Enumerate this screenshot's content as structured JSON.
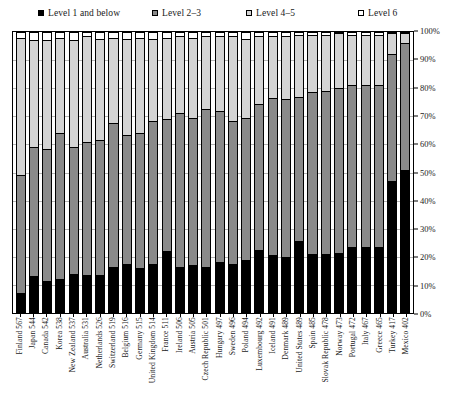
{
  "legend": {
    "items": [
      {
        "label": "Level 1 and below",
        "color": "#000000",
        "key": "l1"
      },
      {
        "label": "Level 2–3",
        "color": "#8a8a8a",
        "key": "l23"
      },
      {
        "label": "Level 4–5",
        "color": "#d4d4d4",
        "key": "l45"
      },
      {
        "label": "Level 6",
        "color": "#ffffff",
        "key": "l6"
      }
    ]
  },
  "chart_data": {
    "type": "bar",
    "subtype": "stacked-bar-100-percent",
    "title": "",
    "xlabel": "",
    "ylabel": "",
    "ylim": [
      0,
      100
    ],
    "ytick_labels": [
      "0%",
      "10%",
      "20%",
      "30%",
      "40%",
      "50%",
      "60%",
      "70%",
      "80%",
      "90%",
      "100%"
    ],
    "ytick_values": [
      0,
      10,
      20,
      30,
      40,
      50,
      60,
      70,
      80,
      90,
      100
    ],
    "yaxis_position": "right",
    "grid": true,
    "legend_position": "top",
    "series": [
      {
        "name": "Level 1 and below",
        "color": "#000000",
        "values": [
          7.0,
          13.0,
          11.5,
          12.0,
          14.0,
          13.5,
          13.5,
          16.5,
          17.5,
          16.0,
          17.5,
          22.0,
          16.5,
          17.0,
          16.5,
          18.0,
          17.5,
          19.0,
          22.5,
          20.5,
          20.0,
          25.5,
          21.0,
          21.0,
          21.5,
          23.5,
          23.5,
          23.5,
          47.0,
          51.0
        ]
      },
      {
        "name": "Level 2–3",
        "color": "#8a8a8a",
        "values": [
          42.0,
          46.0,
          47.0,
          52.0,
          45.0,
          47.5,
          48.0,
          51.0,
          46.0,
          48.0,
          51.0,
          47.0,
          54.5,
          52.5,
          56.0,
          54.0,
          51.0,
          50.5,
          52.0,
          56.0,
          56.0,
          51.5,
          57.5,
          58.0,
          59.0,
          57.5,
          57.5,
          57.5,
          45.0,
          45.5
        ]
      },
      {
        "name": "Level 4–5",
        "color": "#d4d4d4",
        "values": [
          49.0,
          38.0,
          38.5,
          34.0,
          38.0,
          37.5,
          36.0,
          30.5,
          34.0,
          34.0,
          29.0,
          29.0,
          27.5,
          28.5,
          26.0,
          26.5,
          30.0,
          28.0,
          24.0,
          22.0,
          22.5,
          22.0,
          20.5,
          20.0,
          19.5,
          18.0,
          18.0,
          18.0,
          7.5,
          3.4
        ]
      },
      {
        "name": "Level 6",
        "color": "#ffffff",
        "values": [
          2.0,
          3.0,
          3.0,
          2.0,
          3.0,
          1.5,
          2.5,
          2.0,
          2.5,
          2.0,
          2.5,
          2.0,
          1.5,
          2.0,
          1.5,
          1.5,
          1.5,
          2.5,
          1.5,
          1.5,
          1.5,
          1.0,
          1.0,
          1.0,
          0.0,
          1.0,
          1.0,
          1.0,
          0.5,
          0.1
        ]
      }
    ],
    "categories": [
      "Finland 567",
      "Japan 544",
      "Canada 542",
      "Korea 538",
      "New Zealand 537",
      "Australia 531",
      "Netherlands 526",
      "Switzerland 519",
      "Belgium 516",
      "Germany 515",
      "United Kingdom 514",
      "France 511",
      "Ireland 506",
      "Austria 505",
      "Czech Republic 501",
      "Hungary 497",
      "Sweden 496",
      "Poland 494",
      "Luxembourg 492",
      "Iceland 491",
      "Denmark 489",
      "United States 489",
      "Spain 485",
      "Slovak Republic 478",
      "Norway 473",
      "Portugal 472",
      "Italy 467",
      "Greece 465",
      "Turkey 417",
      "Mexico 402"
    ]
  }
}
